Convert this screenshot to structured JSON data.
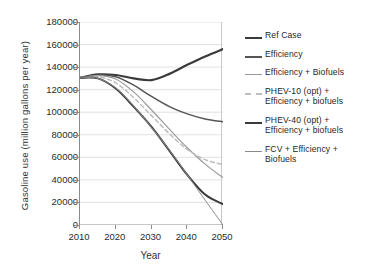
{
  "chart_data": {
    "type": "line",
    "title": "",
    "xlabel": "Year",
    "ylabel": "Gasoline use (million gallons per year)",
    "xlim": [
      2010,
      2050
    ],
    "ylim": [
      0,
      180000
    ],
    "xticks": [
      2010,
      2020,
      2030,
      2040,
      2050
    ],
    "yticks": [
      0,
      20000,
      40000,
      60000,
      80000,
      100000,
      120000,
      140000,
      160000,
      180000
    ],
    "grid": true,
    "legend_position": "right",
    "x": [
      2010,
      2015,
      2020,
      2025,
      2030,
      2035,
      2040,
      2045,
      2050
    ],
    "series": [
      {
        "name": "Ref Case",
        "color": "#3a3a3a",
        "width": 2.2,
        "dash": "none",
        "values": [
          130500,
          133500,
          133000,
          130000,
          128500,
          134000,
          142000,
          149500,
          156000
        ]
      },
      {
        "name": "Efficiency",
        "color": "#555555",
        "width": 1.5,
        "dash": "none",
        "values": [
          130500,
          133000,
          131500,
          124000,
          114000,
          105000,
          98500,
          94000,
          91500
        ]
      },
      {
        "name": "Efficiency + Biofuels",
        "color": "#9a9a9a",
        "width": 1.2,
        "dash": "none",
        "values": [
          130500,
          132500,
          129500,
          118000,
          102000,
          85000,
          68500,
          54000,
          42000
        ]
      },
      {
        "name": "PHEV-10 (opt) + Efficiency + biofuels",
        "color": "#bdbdbd",
        "width": 1.5,
        "dash": "4 3",
        "values": [
          130500,
          131500,
          126000,
          113000,
          97000,
          81000,
          67000,
          58000,
          53500
        ]
      },
      {
        "name": "PHEV-40 (opt) + Efficiency + biofuels",
        "color": "#3a3a3a",
        "width": 2.0,
        "dash": "none",
        "values": [
          130500,
          130000,
          121000,
          105000,
          87000,
          66000,
          44500,
          27000,
          18500
        ]
      },
      {
        "name": "FCV + Efficiency + Biofuels",
        "color": "#8a8a8a",
        "width": 1.0,
        "dash": "none",
        "values": [
          130500,
          130000,
          121500,
          105500,
          86500,
          66500,
          44500,
          22000,
          0
        ]
      }
    ]
  },
  "legend": {
    "items": [
      {
        "label": "Ref Case",
        "lines": [
          "Ref Case"
        ]
      },
      {
        "label": "Efficiency",
        "lines": [
          "Efficiency"
        ]
      },
      {
        "label": "Efficiency + Biofuels",
        "lines": [
          "Efficiency + Biofuels"
        ]
      },
      {
        "label": "PHEV-10 (opt) + Efficiency + biofuels",
        "lines": [
          "PHEV-10 (opt) +",
          "Efficiency + biofuels"
        ]
      },
      {
        "label": "PHEV-40 (opt) + Efficiency + biofuels",
        "lines": [
          "PHEV-40 (opt) +",
          "Efficiency + biofuels"
        ]
      },
      {
        "label": "FCV + Efficiency + Biofuels",
        "lines": [
          "FCV + Efficiency +",
          "Biofuels"
        ]
      }
    ]
  },
  "axis": {
    "y_title": "Gasoline use (million gallons per year)",
    "x_title": "Year"
  },
  "colors": {
    "grid": "#d9d9d9",
    "axis": "#8c8c8c",
    "text": "#2b2b2b",
    "background": "#ffffff"
  }
}
